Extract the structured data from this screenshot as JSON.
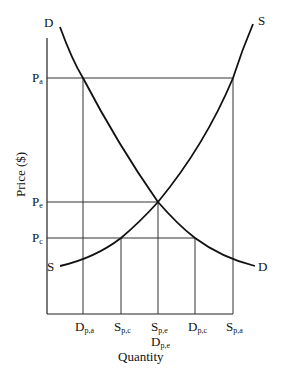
{
  "diagram": {
    "type": "supply-demand",
    "axis_labels": {
      "y": "Price ($)",
      "x": "Quantity"
    },
    "curve_labels": {
      "demand_top": "D",
      "demand_bottom": "D",
      "supply_top": "S",
      "supply_bottom": "S"
    },
    "price_labels": [
      {
        "main": "P",
        "sub": "a"
      },
      {
        "main": "P",
        "sub": "e"
      },
      {
        "main": "P",
        "sub": "c"
      }
    ],
    "quantity_labels": [
      {
        "main": "D",
        "sub": "p,a"
      },
      {
        "main": "S",
        "sub": "p,c"
      },
      {
        "main": "S",
        "sub": "p,e"
      },
      {
        "main": "D",
        "sub": "p,c"
      },
      {
        "main": "S",
        "sub": "p,a"
      }
    ],
    "quantity_label_extra": {
      "main": "D",
      "sub": "p,e"
    },
    "line_color": "#111111"
  }
}
